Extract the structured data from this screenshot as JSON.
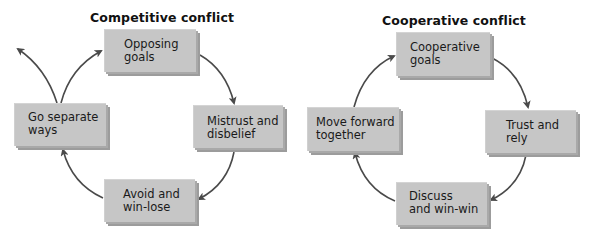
{
  "diagrams": [
    {
      "title": "Competitive conflict",
      "nodes": [
        {
          "id": "opposing",
          "line1": "Opposing",
          "line2": "goals"
        },
        {
          "id": "mistrust",
          "line1": "Mistrust and",
          "line2": "disbelief"
        },
        {
          "id": "avoid",
          "line1": "Avoid and",
          "line2": "win-lose"
        },
        {
          "id": "separate",
          "line1": "Go separate",
          "line2": "ways"
        }
      ],
      "edges": [
        [
          "opposing",
          "mistrust"
        ],
        [
          "mistrust",
          "avoid"
        ],
        [
          "avoid",
          "separate"
        ],
        [
          "separate",
          "opposing"
        ],
        [
          "separate",
          "exit"
        ]
      ]
    },
    {
      "title": "Cooperative conflict",
      "nodes": [
        {
          "id": "coopgoals",
          "line1": "Cooperative",
          "line2": "goals"
        },
        {
          "id": "trust",
          "line1": "Trust and",
          "line2": "rely"
        },
        {
          "id": "discuss",
          "line1": "Discuss",
          "line2": "and win-win"
        },
        {
          "id": "forward",
          "line1": "Move forward",
          "line2": "together"
        }
      ],
      "edges": [
        [
          "coopgoals",
          "trust"
        ],
        [
          "trust",
          "discuss"
        ],
        [
          "discuss",
          "forward"
        ],
        [
          "forward",
          "coopgoals"
        ]
      ]
    }
  ],
  "colors": {
    "box_fill": "#c6c6c6",
    "box_shadow": "#9c9c9c",
    "arrow": "#4a4a4a",
    "text": "#1a1a1a"
  }
}
